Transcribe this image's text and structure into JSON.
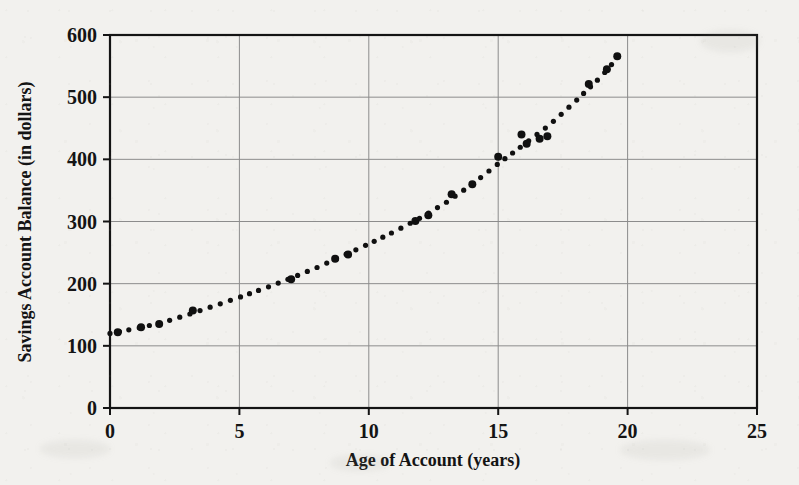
{
  "figure": {
    "background_color": "#f2f1ee",
    "ink_color": "#141414",
    "grid_color": "#8c8c8c"
  },
  "chart_data": {
    "type": "scatter",
    "title": "",
    "subtitle": "",
    "xlabel": "Age of Account (years)",
    "ylabel": "Savings Account Balance (in dollars)",
    "xlim": [
      0,
      25
    ],
    "ylim": [
      0,
      600
    ],
    "xticks": [
      0,
      5,
      10,
      15,
      20,
      25
    ],
    "yticks": [
      0,
      100,
      200,
      300,
      400,
      500,
      600
    ],
    "xtick_labels": [
      "0",
      "5",
      "10",
      "15",
      "20",
      "25"
    ],
    "ytick_labels": [
      "0",
      "100",
      "200",
      "300",
      "400",
      "500",
      "600"
    ],
    "grid": true,
    "grid_axes": "both",
    "legend": false,
    "legend_position": "none",
    "marker": "filled-circle",
    "marker_color": "#101010",
    "marker_size_px": 8,
    "trend_line": {
      "style": "dotted",
      "color": "#101010",
      "dot_size_px": 3.4,
      "description": "dotted curve rising through the points"
    },
    "x": [
      0.3,
      1.2,
      1.9,
      3.2,
      7.0,
      8.7,
      9.2,
      11.8,
      12.3,
      13.2,
      14.0,
      15.0,
      15.9,
      16.1,
      16.6,
      16.9,
      18.5,
      19.2,
      19.6
    ],
    "y": [
      122,
      130,
      135,
      157,
      207,
      240,
      247,
      301,
      310,
      344,
      360,
      404,
      440,
      425,
      433,
      437,
      521,
      545,
      566
    ],
    "points": [
      {
        "x": 0.3,
        "y": 122
      },
      {
        "x": 1.2,
        "y": 130
      },
      {
        "x": 1.9,
        "y": 135
      },
      {
        "x": 3.2,
        "y": 157
      },
      {
        "x": 7.0,
        "y": 207
      },
      {
        "x": 8.7,
        "y": 240
      },
      {
        "x": 9.2,
        "y": 247
      },
      {
        "x": 11.8,
        "y": 301
      },
      {
        "x": 12.3,
        "y": 310
      },
      {
        "x": 13.2,
        "y": 344
      },
      {
        "x": 14.0,
        "y": 360
      },
      {
        "x": 15.0,
        "y": 404
      },
      {
        "x": 15.9,
        "y": 440
      },
      {
        "x": 16.1,
        "y": 425
      },
      {
        "x": 16.6,
        "y": 433
      },
      {
        "x": 16.9,
        "y": 437
      },
      {
        "x": 18.5,
        "y": 521
      },
      {
        "x": 19.2,
        "y": 545
      },
      {
        "x": 19.6,
        "y": 566
      }
    ],
    "curve": [
      {
        "x": 0.0,
        "y": 120
      },
      {
        "x": 1.0,
        "y": 128
      },
      {
        "x": 2.0,
        "y": 137
      },
      {
        "x": 3.0,
        "y": 150
      },
      {
        "x": 4.0,
        "y": 164
      },
      {
        "x": 5.0,
        "y": 178
      },
      {
        "x": 6.0,
        "y": 193
      },
      {
        "x": 7.0,
        "y": 209
      },
      {
        "x": 8.0,
        "y": 226
      },
      {
        "x": 9.0,
        "y": 245
      },
      {
        "x": 10.0,
        "y": 264
      },
      {
        "x": 11.0,
        "y": 284
      },
      {
        "x": 12.0,
        "y": 306
      },
      {
        "x": 13.0,
        "y": 331
      },
      {
        "x": 14.0,
        "y": 360
      },
      {
        "x": 15.0,
        "y": 393
      },
      {
        "x": 16.0,
        "y": 424
      },
      {
        "x": 17.0,
        "y": 456
      },
      {
        "x": 18.0,
        "y": 494
      },
      {
        "x": 19.0,
        "y": 534
      },
      {
        "x": 19.7,
        "y": 568
      }
    ]
  }
}
